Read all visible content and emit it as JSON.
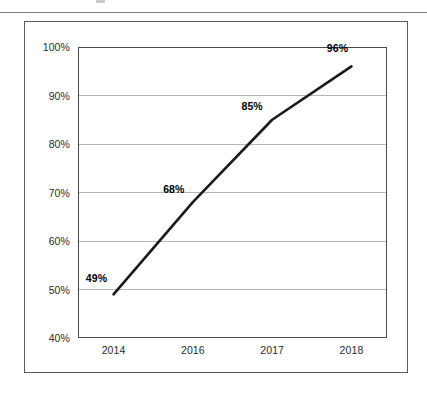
{
  "page": {
    "has_top_rule": true,
    "background_color": "#ffffff"
  },
  "figure": {
    "frame_border_color": "#595959",
    "plot_border_color": "#4a4a4a",
    "gridline_color": "#b5b5b5",
    "series_color": "#1a1a1a"
  },
  "chart_data": {
    "type": "line",
    "title": "",
    "subtitle": "",
    "xlabel": "",
    "ylabel": "",
    "categories": [
      "2014",
      "2016",
      "2017",
      "2018"
    ],
    "values": [
      49,
      68,
      85,
      96
    ],
    "data_labels": [
      "49%",
      "68%",
      "85%",
      "96%"
    ],
    "ytick_labels": [
      "40%",
      "50%",
      "60%",
      "70%",
      "80%",
      "90%",
      "100%"
    ],
    "ytick_values": [
      40,
      50,
      60,
      70,
      80,
      90,
      100
    ],
    "ylim": [
      40,
      100
    ],
    "grid": true,
    "grid_axis": "y",
    "legend": false,
    "legend_position": "none",
    "series": [
      {
        "name": "",
        "values": [
          49,
          68,
          85,
          96
        ]
      }
    ]
  }
}
